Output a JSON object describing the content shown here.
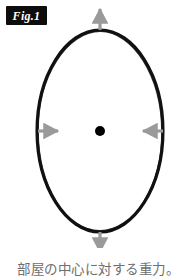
{
  "figure": {
    "badge_label": "Fig.1",
    "caption": "部屋の中心に対する重力。"
  },
  "colors": {
    "outline": "#111111",
    "arrow": "#9a9a9a",
    "center_dot": "#000000",
    "caption_text": "#6e6e6e",
    "badge_background": "#0d0d0d",
    "badge_text": "#ffffff",
    "background": "#ffffff"
  },
  "diagram": {
    "type": "gravity-direction-diagram",
    "shape": "ellipse",
    "ellipse": {
      "cx": 100,
      "cy": 131,
      "rx": 63,
      "ry": 101
    },
    "center_dot": {
      "cx": 100,
      "cy": 131,
      "r": 5
    },
    "arrows": [
      {
        "name": "arrow-up",
        "direction": "up",
        "points": "outward",
        "x1": 100,
        "y1": 30,
        "x2": 100,
        "y2": 6
      },
      {
        "name": "arrow-down",
        "direction": "down",
        "points": "outward",
        "x1": 100,
        "y1": 232,
        "x2": 100,
        "y2": 258
      },
      {
        "name": "arrow-left",
        "direction": "right",
        "points": "inward",
        "x1": 38,
        "y1": 131,
        "x2": 62,
        "y2": 131
      },
      {
        "name": "arrow-right",
        "direction": "left",
        "points": "inward",
        "x1": 163,
        "y1": 131,
        "x2": 139,
        "y2": 131
      }
    ]
  }
}
